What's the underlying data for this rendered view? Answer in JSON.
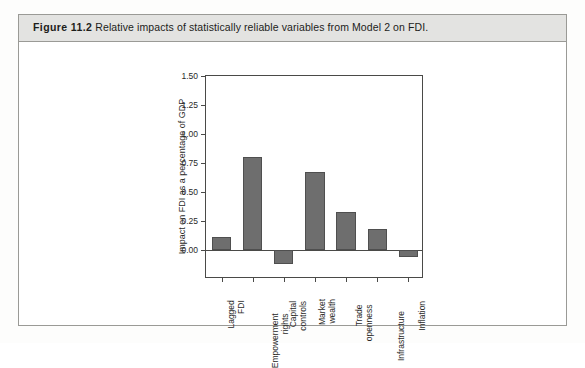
{
  "figure": {
    "number": "Figure 11.2",
    "caption": "Relative impacts of statistically reliable variables from Model 2 on FDI."
  },
  "chart_data": {
    "type": "bar",
    "title": "",
    "xlabel": "",
    "ylabel": "Impact on FDI as a percentage of GDP",
    "categories": [
      "Lagged FDI",
      "Empowerment rights",
      "Capital controls",
      "Market wealth",
      "Trade openness",
      "Infrastructure",
      "Inflation"
    ],
    "category_lines": [
      [
        "Lagged",
        "FDI"
      ],
      [
        "Empowerment",
        "rights"
      ],
      [
        "Capital",
        "controls"
      ],
      [
        "Market",
        "wealth"
      ],
      [
        "Trade",
        "openness"
      ],
      [
        "Infrastructure"
      ],
      [
        "Inflation"
      ]
    ],
    "values": [
      0.11,
      0.8,
      -0.12,
      0.67,
      0.33,
      0.18,
      -0.06
    ],
    "ylim": [
      -0.25,
      1.5
    ],
    "yticks": [
      0.0,
      0.25,
      0.5,
      0.75,
      1.0,
      1.25,
      1.5
    ],
    "ytick_labels": [
      "0.00",
      "0.25",
      "0.50",
      "0.75",
      "1.00",
      "1.25",
      "1.50"
    ],
    "grid": false,
    "legend": null,
    "bar_color": "#6e6e6e",
    "bar_edge_color": "#4f4f4f",
    "axis_color": "#4a4a48"
  }
}
